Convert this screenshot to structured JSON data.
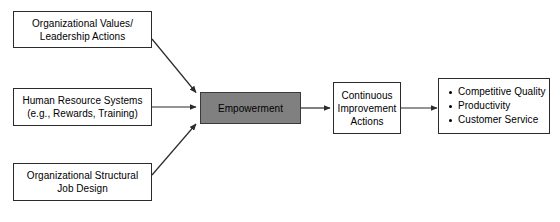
{
  "diagram": {
    "background_color": "#ffffff",
    "line_color": "#2b2b2b",
    "accent_fill": "#808080",
    "nodes": {
      "organizational_values": {
        "label": "Organizational Values/\nLeadership Actions"
      },
      "human_resource_systems": {
        "label": "Human Resource Systems\n(e.g., Rewards, Training)"
      },
      "organizational_structure": {
        "label": "Organizational Structural\nJob Design"
      },
      "empowerment": {
        "label": "Empowerment"
      },
      "continuous_improvement": {
        "label": "Continuous\nImprovement\nActions"
      },
      "outcomes": {
        "items": [
          "Competitive Quality",
          "Productivity",
          "Customer Service"
        ]
      }
    },
    "connectors": [
      {
        "name": "values-to-empowerment",
        "from": "organizational_values",
        "to": "empowerment",
        "style": "diagonal-down"
      },
      {
        "name": "hr-to-empowerment",
        "from": "human_resource_systems",
        "to": "empowerment",
        "style": "horizontal"
      },
      {
        "name": "structure-to-empowerment",
        "from": "organizational_structure",
        "to": "empowerment",
        "style": "diagonal-up"
      },
      {
        "name": "empowerment-to-improvement",
        "from": "empowerment",
        "to": "continuous_improvement",
        "style": "horizontal"
      },
      {
        "name": "improvement-to-outcomes",
        "from": "continuous_improvement",
        "to": "outcomes",
        "style": "horizontal"
      }
    ]
  }
}
